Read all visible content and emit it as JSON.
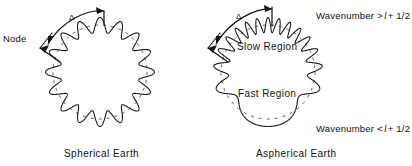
{
  "figure": {
    "panels": [
      {
        "id": "spherical",
        "caption": "Spherical  Earth",
        "center": {
          "x": 100,
          "y": 72
        },
        "base_radius": 47,
        "amplitude": 7.5,
        "lobes": 16,
        "annotations": {
          "delta_symbol": "Δ",
          "node_label": "Node"
        }
      },
      {
        "id": "aspherical",
        "caption": "Aspherical  Earth",
        "center": {
          "x": 268,
          "y": 72
        },
        "base_radius": 47,
        "amplitude": 7.5,
        "lobes": 16,
        "annotations": {
          "delta_symbol": "Δ",
          "slow_region_label": "Slow  Region",
          "fast_region_label": "Fast  Region",
          "wavenumber_top": {
            "prefix": "Wavenumber",
            "relation": ">",
            "symbol": "l",
            "plus": "+ 1/2"
          },
          "wavenumber_bottom": {
            "prefix": "Wavenumber",
            "relation": "<",
            "symbol": "l",
            "plus": "+ 1/2"
          }
        }
      }
    ]
  },
  "colors": {
    "ink": "#1a1a1a",
    "background": "#ffffff",
    "guide": "#2a2a2a"
  },
  "chart_data": {
    "type": "line",
    "xlabel": "",
    "ylabel": "",
    "series": [
      {
        "name": "Spherical Earth standing wave",
        "description": "Radial displacement of a uniform standing wave around a circle; constant wavelength everywhere",
        "lobes": 16,
        "base_radius": 47,
        "amplitude": 7.5,
        "wavenumber_variation": "none"
      },
      {
        "name": "Aspherical Earth standing wave",
        "description": "Radial displacement around a circle with laterally varying wavelength: shorter wavelength (higher wavenumber) in the slow region at top, longer wavelength (lower wavenumber) in the fast region at bottom",
        "lobes": 16,
        "base_radius": 47,
        "amplitude": 7.5,
        "wavenumber_variation": "top > l + 1/2, bottom < l + 1/2"
      }
    ],
    "annotations": [
      "Δ",
      "Node",
      "Wavenumber > l + 1/2",
      "Slow  Region",
      "Fast  Region",
      "Wavenumber < l + 1/2",
      "Spherical  Earth",
      "Aspherical  Earth"
    ],
    "legend_position": "none",
    "grid": false
  }
}
